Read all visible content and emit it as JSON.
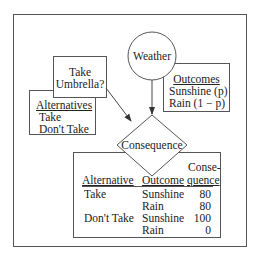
{
  "diagram": {
    "type": "influence-diagram",
    "nodes": {
      "decision": {
        "shape": "rectangle",
        "label_lines": [
          "Take",
          "Umbrella?"
        ],
        "table": {
          "header": "Alternatives",
          "items": [
            "Take",
            "Don't Take"
          ]
        }
      },
      "chance": {
        "shape": "circle",
        "label": "Weather",
        "table": {
          "header": "Outcomes",
          "items": [
            "Sunshine (p)",
            "Rain (1 − p)"
          ]
        }
      },
      "consequence": {
        "shape": "diamond",
        "label": "Consequence",
        "table": {
          "headers": {
            "alternative": "Alternative",
            "outcome": "Outcome",
            "consequence_line1": "Conse-",
            "consequence_line2": "quence"
          },
          "rows": [
            {
              "alternative": "Take",
              "outcome": "Sunshine",
              "value": "80"
            },
            {
              "alternative": "",
              "outcome": "Rain",
              "value": "80"
            },
            {
              "alternative": "Don't Take",
              "outcome": "Sunshine",
              "value": "100"
            },
            {
              "alternative": "",
              "outcome": "Rain",
              "value": "0"
            }
          ]
        }
      }
    },
    "edges": [
      {
        "from": "decision",
        "to": "consequence"
      },
      {
        "from": "chance",
        "to": "consequence"
      }
    ]
  }
}
